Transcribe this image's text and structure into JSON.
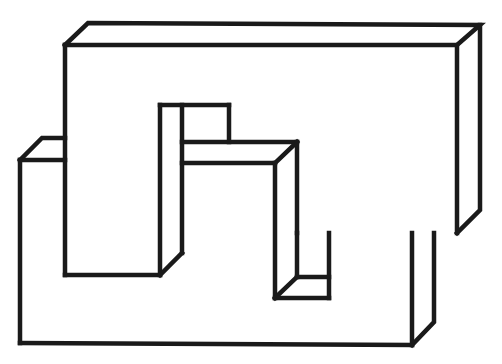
{
  "figure": {
    "stroke_color": "#1a1a1a",
    "background_color": "#ffffff",
    "stroke_width": 4.5
  },
  "shapes": {
    "upper_block": {
      "front_face": [
        [
          65,
          45
        ],
        [
          457,
          45
        ],
        [
          457,
          233
        ]
      ],
      "top_face": [
        [
          65,
          45
        ],
        [
          88,
          23
        ],
        [
          480,
          25
        ],
        [
          457,
          45
        ]
      ],
      "right_face": [
        [
          480,
          25
        ],
        [
          480,
          210
        ],
        [
          457,
          233
        ]
      ]
    },
    "lower_block": {
      "left_top": [
        [
          20,
          160
        ],
        [
          42,
          138
        ],
        [
          65,
          138
        ]
      ],
      "front_left": [
        [
          20,
          160
        ],
        [
          65,
          160
        ]
      ],
      "left_edge": [
        [
          20,
          160
        ],
        [
          20,
          343
        ]
      ],
      "bottom_edge": [
        [
          20,
          343
        ],
        [
          412,
          345
        ]
      ],
      "right_face": [
        [
          412,
          345
        ],
        [
          434,
          322
        ],
        [
          434,
          233
        ]
      ],
      "right_front_edge": [
        [
          412,
          233
        ],
        [
          412,
          345
        ]
      ]
    },
    "inner_bar": {
      "left_edge": [
        [
          65,
          45
        ],
        [
          65,
          275
        ]
      ],
      "bottom": [
        [
          65,
          275
        ],
        [
          160,
          275
        ]
      ],
      "front_right": [
        [
          160,
          105
        ],
        [
          160,
          275
        ]
      ],
      "bevel": [
        [
          160,
          275
        ],
        [
          182,
          253
        ]
      ],
      "back_right": [
        [
          182,
          105
        ],
        [
          182,
          253
        ]
      ]
    },
    "notch": {
      "top": [
        [
          160,
          105
        ],
        [
          229,
          105
        ]
      ],
      "right": [
        [
          229,
          105
        ],
        [
          229,
          142
        ]
      ]
    },
    "middle_block": {
      "top_back": [
        [
          182,
          142
        ],
        [
          297,
          142
        ]
      ],
      "top_front": [
        [
          182,
          163
        ],
        [
          275,
          163
        ]
      ],
      "bevel": [
        [
          297,
          142
        ],
        [
          275,
          163
        ]
      ],
      "front_right": [
        [
          275,
          163
        ],
        [
          275,
          298
        ]
      ],
      "back_right": [
        [
          297,
          142
        ],
        [
          297,
          233
        ]
      ]
    },
    "lower_notch": {
      "floor_back": [
        [
          297,
          277
        ],
        [
          329,
          277
        ]
      ],
      "bevel": [
        [
          275,
          298
        ],
        [
          297,
          277
        ]
      ],
      "floor_front": [
        [
          275,
          298
        ],
        [
          329,
          298
        ]
      ],
      "right": [
        [
          329,
          233
        ],
        [
          329,
          298
        ]
      ],
      "back_left": [
        [
          297,
          233
        ],
        [
          297,
          277
        ]
      ]
    }
  }
}
